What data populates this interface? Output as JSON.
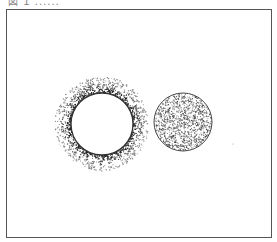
{
  "figure": {
    "caption": "図 1 ......",
    "colors": {
      "ink": "#333333",
      "frame": "#555555",
      "background": "#ffffff"
    },
    "left_circle": {
      "label": "hollow circle with speckled halo",
      "cx": 102,
      "cy": 124,
      "r": 31,
      "halo_width": 16
    },
    "right_circle": {
      "label": "speckle-filled circle",
      "cx": 183,
      "cy": 122,
      "r": 29
    },
    "stray_dot": {
      "cx": 233,
      "cy": 144
    }
  }
}
